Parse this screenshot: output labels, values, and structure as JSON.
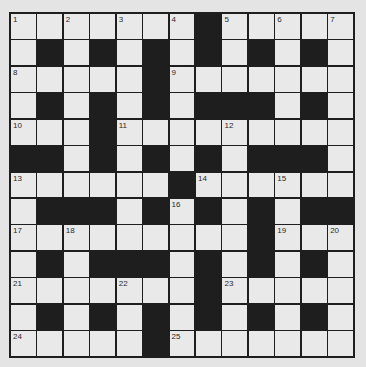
{
  "puzzle": {
    "type": "crossword",
    "rows": 13,
    "cols": 13,
    "colors": {
      "black": "#1e1e1e",
      "white": "#e9e9e9",
      "background": "#e4e4e4"
    },
    "layout": [
      ".......#.....",
      ".#.#.#.#.#.#.",
      ".....#.......",
      ".#.#.#.###.#.",
      "...#.........",
      "##.#.#.#.###.",
      "......#......",
      ".###.#.#.#.##",
      ".........#...",
      ".#.###.#.#.#.",
      ".......#.....",
      ".#.#.#.#.#.#.",
      ".....#......."
    ],
    "numbers": [
      {
        "r": 0,
        "c": 0,
        "n": "1"
      },
      {
        "r": 0,
        "c": 2,
        "n": "2"
      },
      {
        "r": 0,
        "c": 4,
        "n": "3"
      },
      {
        "r": 0,
        "c": 6,
        "n": "4"
      },
      {
        "r": 0,
        "c": 8,
        "n": "5"
      },
      {
        "r": 0,
        "c": 10,
        "n": "6"
      },
      {
        "r": 0,
        "c": 12,
        "n": "7"
      },
      {
        "r": 2,
        "c": 0,
        "n": "8"
      },
      {
        "r": 2,
        "c": 6,
        "n": "9"
      },
      {
        "r": 4,
        "c": 0,
        "n": "10"
      },
      {
        "r": 4,
        "c": 4,
        "n": "11"
      },
      {
        "r": 4,
        "c": 8,
        "n": "12"
      },
      {
        "r": 6,
        "c": 0,
        "n": "13"
      },
      {
        "r": 6,
        "c": 7,
        "n": "14"
      },
      {
        "r": 6,
        "c": 10,
        "n": "15"
      },
      {
        "r": 7,
        "c": 6,
        "n": "16"
      },
      {
        "r": 8,
        "c": 0,
        "n": "17"
      },
      {
        "r": 8,
        "c": 2,
        "n": "18"
      },
      {
        "r": 8,
        "c": 10,
        "n": "19"
      },
      {
        "r": 8,
        "c": 12,
        "n": "20"
      },
      {
        "r": 10,
        "c": 0,
        "n": "21"
      },
      {
        "r": 10,
        "c": 4,
        "n": "22"
      },
      {
        "r": 10,
        "c": 8,
        "n": "23"
      },
      {
        "r": 12,
        "c": 0,
        "n": "24"
      },
      {
        "r": 12,
        "c": 6,
        "n": "25"
      }
    ]
  }
}
